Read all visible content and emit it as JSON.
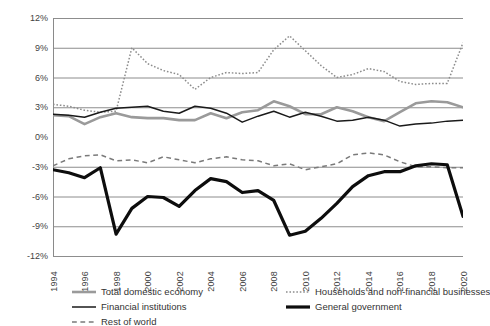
{
  "chart_data": {
    "type": "line",
    "title": "",
    "xlabel": "",
    "ylabel": "percent of GDP",
    "ylim": [
      -12,
      12
    ],
    "ytick_step": 3,
    "grid": true,
    "grid_color": "#808080",
    "legend_position": "bottom",
    "ytick_labels": [
      "12%",
      "9%",
      "6%",
      "3%",
      "0%",
      "-3%",
      "-6%",
      "-9%",
      "-12%"
    ],
    "ytick_values": [
      12,
      9,
      6,
      3,
      0,
      -3,
      -6,
      -9,
      -12
    ],
    "x": [
      1994,
      1995,
      1996,
      1997,
      1998,
      1999,
      2000,
      2001,
      2002,
      2003,
      2004,
      2005,
      2006,
      2007,
      2008,
      2009,
      2010,
      2011,
      2012,
      2013,
      2014,
      2015,
      2016,
      2017,
      2018,
      2019,
      2020
    ],
    "xtick_labels": [
      "1994",
      "1996",
      "1998",
      "2000",
      "2002",
      "2004",
      "2006",
      "2008",
      "2010",
      "2012",
      "2014",
      "2016",
      "2018",
      "2020"
    ],
    "xtick_values": [
      1994,
      1996,
      1998,
      2000,
      2002,
      2004,
      2006,
      2008,
      2010,
      2012,
      2014,
      2016,
      2018,
      2020
    ],
    "series": [
      {
        "name": "Total domestic economy",
        "color": "#9a9a9a",
        "style": "solid",
        "width": 2.6,
        "values": [
          2.2,
          2.1,
          1.3,
          2.0,
          2.4,
          2.0,
          1.9,
          1.9,
          1.7,
          1.7,
          2.4,
          1.9,
          2.5,
          2.7,
          3.6,
          3.1,
          2.3,
          2.3,
          3.0,
          2.6,
          2.0,
          1.6,
          2.5,
          3.4,
          3.6,
          3.5,
          3.0
        ]
      },
      {
        "name": "Financial institutions",
        "color": "#1a1a1a",
        "style": "solid",
        "width": 1.5,
        "values": [
          2.3,
          2.2,
          2.0,
          2.5,
          2.9,
          3.0,
          3.1,
          2.6,
          2.4,
          3.1,
          2.9,
          2.4,
          1.5,
          2.1,
          2.6,
          2.0,
          2.5,
          2.1,
          1.6,
          1.7,
          2.0,
          1.7,
          1.1,
          1.3,
          1.4,
          1.6,
          1.7
        ]
      },
      {
        "name": "Rest of world",
        "color": "#7a7a7a",
        "style": "dashed",
        "width": 1.5,
        "values": [
          -2.9,
          -2.2,
          -1.9,
          -1.8,
          -2.4,
          -2.3,
          -2.6,
          -2.0,
          -2.3,
          -2.6,
          -2.2,
          -2.0,
          -2.3,
          -2.4,
          -2.9,
          -2.7,
          -3.3,
          -3.0,
          -2.7,
          -1.8,
          -1.6,
          -1.8,
          -2.5,
          -3.0,
          -3.0,
          -3.1,
          -3.1
        ]
      },
      {
        "name": "Households and non-financial businesses",
        "color": "#8c8c8c",
        "style": "dotted",
        "width": 1.5,
        "values": [
          3.3,
          3.1,
          2.7,
          2.5,
          2.6,
          9.0,
          7.4,
          6.7,
          6.3,
          4.8,
          6.0,
          6.5,
          6.4,
          6.5,
          8.8,
          10.2,
          8.7,
          7.2,
          6.0,
          6.3,
          6.9,
          6.6,
          5.6,
          5.3,
          5.4,
          5.4,
          9.5
        ]
      },
      {
        "name": "General government",
        "color": "#0d0d0d",
        "style": "solid",
        "width": 3.2,
        "values": [
          -3.3,
          -3.6,
          -4.1,
          -3.1,
          -9.8,
          -7.2,
          -6.0,
          -6.1,
          -7.0,
          -5.4,
          -4.2,
          -4.5,
          -5.6,
          -5.4,
          -6.4,
          -9.9,
          -9.5,
          -8.2,
          -6.7,
          -5.0,
          -3.9,
          -3.5,
          -3.5,
          -2.9,
          -2.7,
          -2.8,
          -8.0
        ]
      }
    ]
  }
}
